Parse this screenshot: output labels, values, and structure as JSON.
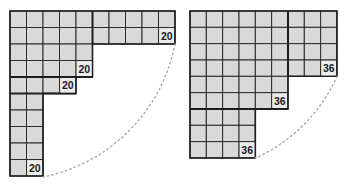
{
  "figures": [
    {
      "id": "left",
      "origin": [
        10,
        11
      ],
      "cell": 16.5,
      "rows": [
        10,
        10,
        5,
        5,
        4,
        2,
        2,
        2,
        2,
        2
      ],
      "labels": [
        {
          "text": "20",
          "row": 1,
          "col": 9
        },
        {
          "text": "20",
          "row": 3,
          "col": 4
        },
        {
          "text": "20",
          "row": 4,
          "col": 3
        },
        {
          "text": "20",
          "row": 9,
          "col": 1
        }
      ],
      "thick_lines": [
        [
          [
            92.5,
            11
          ],
          [
            92.5,
            44
          ]
        ],
        [
          [
            10,
            77
          ],
          [
            92.5,
            77
          ]
        ],
        [
          [
            10,
            93.5
          ],
          [
            76,
            93.5
          ]
        ]
      ],
      "arc": {
        "center": [
          10,
          11
        ],
        "from": [
          175,
          44
        ],
        "to": [
          43,
          177
        ]
      }
    },
    {
      "id": "right",
      "origin": [
        190,
        11
      ],
      "cell": 16.33,
      "rows": [
        9,
        9,
        9,
        9,
        6,
        6,
        4,
        4,
        4
      ],
      "labels": [
        {
          "text": "36",
          "row": 3,
          "col": 8
        },
        {
          "text": "36",
          "row": 5,
          "col": 5
        },
        {
          "text": "36",
          "row": 8,
          "col": 3
        }
      ],
      "thick_lines": [
        [
          [
            288,
            11
          ],
          [
            288,
            76.3
          ]
        ],
        [
          [
            190,
            109
          ],
          [
            288,
            109
          ]
        ]
      ],
      "arc": {
        "center": [
          190,
          11
        ],
        "from": [
          337,
          76.3
        ],
        "to": [
          255.3,
          158
        ]
      }
    }
  ],
  "colors": {
    "cell_fill": "#d9d9d9",
    "grid_line": "#2b2b2b",
    "arc": "#a8a8a8",
    "label": "#1a1a1a"
  }
}
